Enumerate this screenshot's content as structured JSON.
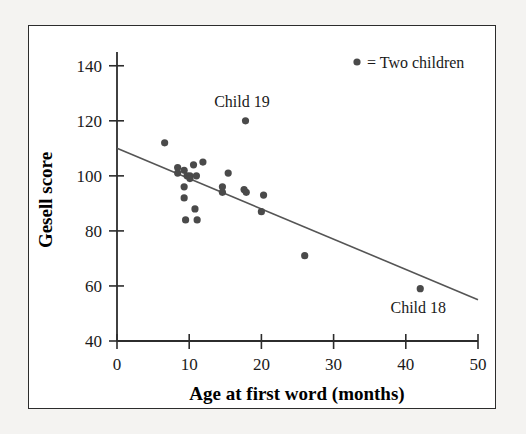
{
  "figure": {
    "background_color": "#f4f3f1",
    "panel_color": "#ffffff",
    "border_color": "#2c2c2c"
  },
  "legend": {
    "marker_icon": "filled-circle-icon",
    "text": "= Two children",
    "marker_color": "#4a4a4a"
  },
  "annotations": [
    {
      "text": "Child 19",
      "x": 18.0,
      "y": 120
    },
    {
      "text": "Child 18",
      "x": 42.0,
      "y": 59
    }
  ],
  "chart_data": {
    "type": "scatter",
    "title": "",
    "xlabel": "Age at first word (months)",
    "ylabel": "Gesell score",
    "xlim": [
      0,
      50
    ],
    "ylim": [
      40,
      145
    ],
    "xticks": [
      0,
      10,
      20,
      30,
      40,
      50
    ],
    "yticks": [
      40,
      60,
      80,
      100,
      120,
      140
    ],
    "xtick_labels": [
      "0",
      "10",
      "20",
      "30",
      "40",
      "50"
    ],
    "ytick_labels": [
      "40",
      "60",
      "80",
      "100",
      "120",
      "140"
    ],
    "grid": false,
    "legend_position": "top-right",
    "point_color": "#4a4a4a",
    "point_radius": 3.6,
    "series": [
      {
        "name": "Children",
        "points": [
          {
            "x": 6.6,
            "y": 112
          },
          {
            "x": 8.4,
            "y": 103
          },
          {
            "x": 8.4,
            "y": 101
          },
          {
            "x": 9.3,
            "y": 102
          },
          {
            "x": 9.7,
            "y": 100
          },
          {
            "x": 10.1,
            "y": 100
          },
          {
            "x": 10.1,
            "y": 99
          },
          {
            "x": 10.6,
            "y": 104
          },
          {
            "x": 11.0,
            "y": 100
          },
          {
            "x": 11.9,
            "y": 105
          },
          {
            "x": 9.3,
            "y": 96
          },
          {
            "x": 9.3,
            "y": 92
          },
          {
            "x": 10.8,
            "y": 88
          },
          {
            "x": 9.5,
            "y": 84
          },
          {
            "x": 11.1,
            "y": 84
          },
          {
            "x": 14.6,
            "y": 96
          },
          {
            "x": 14.6,
            "y": 94
          },
          {
            "x": 15.4,
            "y": 101
          },
          {
            "x": 17.6,
            "y": 95
          },
          {
            "x": 17.9,
            "y": 94
          },
          {
            "x": 20.3,
            "y": 93
          },
          {
            "x": 20.0,
            "y": 87
          },
          {
            "x": 17.8,
            "y": 120
          },
          {
            "x": 26.0,
            "y": 71
          },
          {
            "x": 42.0,
            "y": 59
          }
        ]
      }
    ],
    "trend_line": {
      "name": "least-squares regression line",
      "color": "#555555",
      "x_start": 0,
      "y_start": 110,
      "x_end": 50,
      "y_end": 55
    }
  }
}
